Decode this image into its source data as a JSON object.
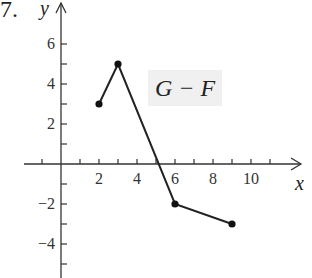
{
  "problem_number": "7.",
  "chart_data": {
    "type": "line",
    "title": "",
    "series": [
      {
        "name": "G − F",
        "points": [
          [
            2,
            3
          ],
          [
            3,
            5
          ],
          [
            6,
            -2
          ],
          [
            9,
            -3
          ]
        ],
        "endpoints": "closed-dots"
      }
    ],
    "xlabel": "x",
    "ylabel": "y",
    "x_ticks_labeled": [
      2,
      4,
      6,
      8,
      10
    ],
    "y_ticks_labeled": [
      6,
      4,
      2,
      -2,
      -4
    ],
    "xlim": [
      -2,
      12
    ],
    "ylim": [
      -5.5,
      7
    ],
    "grid": false,
    "legend": "none",
    "annotations": [
      {
        "text": "G − F",
        "x": 8,
        "y": 4,
        "boxed": true
      }
    ]
  },
  "labels": {
    "function": "G − F",
    "x_axis": "x",
    "y_axis": "y",
    "x_ticks": [
      "2",
      "4",
      "6",
      "8",
      "10"
    ],
    "y_ticks": [
      "6",
      "4",
      "2",
      "−2",
      "−4"
    ]
  }
}
